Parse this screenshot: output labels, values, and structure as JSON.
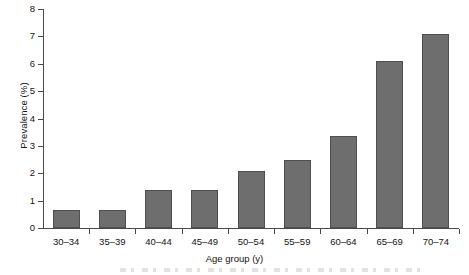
{
  "chart_data": {
    "type": "bar",
    "title": "",
    "xlabel": "Age group (y)",
    "ylabel": "Prevalence (%)",
    "categories": [
      "30–34",
      "35–39",
      "40–44",
      "45–49",
      "50–54",
      "55–59",
      "60–64",
      "65–69",
      "70–74"
    ],
    "values": [
      0.65,
      0.65,
      1.4,
      1.4,
      2.1,
      2.5,
      3.35,
      6.1,
      7.1
    ],
    "ylim": [
      0,
      8
    ],
    "ytick_labels": [
      "0",
      "1",
      "2",
      "3",
      "4",
      "5",
      "6",
      "7",
      "8"
    ],
    "ytick_values": [
      0,
      1,
      2,
      3,
      4,
      5,
      6,
      7,
      8
    ],
    "grid": false,
    "legend": false,
    "bar_color": "#6e6e6e",
    "bar_edge_color": "#4f4f4f",
    "axis_color": "#4a4a4a"
  }
}
